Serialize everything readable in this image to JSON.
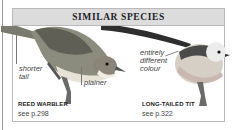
{
  "panel": {
    "title": "SIMILAR SPECIES"
  },
  "species": [
    {
      "name": "REED WARBLER",
      "reference": "see p.298",
      "annotations": [
        "shorter tail",
        "plainer"
      ],
      "annotation_lines": {
        "shorter": "shorter",
        "tail": "tail"
      }
    },
    {
      "name": "LONG-TAILED TIT",
      "reference": "see p.322",
      "annotations": [
        "entirely different colour"
      ],
      "annotation_lines": {
        "l1": "entirely",
        "l2": "different",
        "l3": "colour"
      }
    }
  ],
  "colors": {
    "header_bg": "#dcdcdc",
    "border": "#b8b8b8",
    "text": "#222222"
  }
}
